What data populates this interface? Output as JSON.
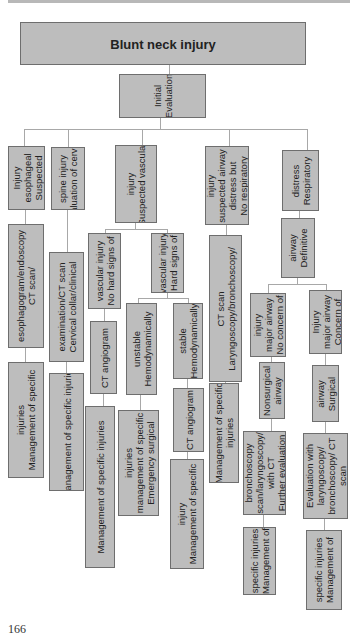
{
  "diagram": {
    "title": "Blunt neck injury",
    "root": "Initial\nEvaluation",
    "branches": {
      "esophageal": {
        "node": "Injury\nesophageal\nSuspected",
        "step1": "esophagogram/endoscopy\nCT scan/",
        "step2": "injuries\nManagement of specific"
      },
      "cervical": {
        "node": "spine injury\nEvaluation of cervical",
        "step1": "examination/CT scan\nCervical collar/clinical",
        "step2": "Management of specific injuries"
      },
      "vascular": {
        "node": "injury\nSuspected vascular",
        "no_hard": {
          "node": "vascular injury\nNo hard signs of",
          "step1": "CT angiogram",
          "step2": "Management of specific injuries"
        },
        "hard": {
          "node": "vascular injury\nHard signs of",
          "unstable": {
            "node": "unstable\nHemodynamically",
            "step1": "injuries\nmanagement of specific\nEmergency surgical"
          },
          "stable": {
            "node": "stable\nHemodynamically",
            "step1": "CT angiogram",
            "step2": "injury\nManagement of specific"
          }
        }
      },
      "airway_no_distress": {
        "node": "injury\nsuspected airway\ndistress but\nNo respiratory",
        "step1": "CT scan\nLaryngoscopy/bronchoscopy/",
        "step2": "Management of specific\ninjuries"
      },
      "respiratory_distress": {
        "node": "distress\nRespiratory",
        "step1": "airway\nDefinitive",
        "no_concern": {
          "node": "injury\nmajor airway\nNo concern of",
          "step1": "Nonsurgical\nairway",
          "step2": "bronchoscopy\nscan/laryngoscopy/\nwith CT\nFurther evaluation",
          "step3": "specific injuries\nManagement of"
        },
        "concern": {
          "node": "Injury\nmajor airway\nConcern of",
          "step1": "airway\nSurgical",
          "step2": "Evaluation with\nlaryngoscopy/\nbronchoscopy/ CT\nscan",
          "step3": "specific injuries\nManagement of"
        }
      }
    }
  },
  "page_number": "166"
}
